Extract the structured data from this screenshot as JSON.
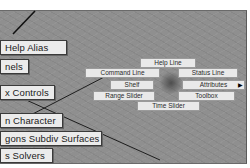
{
  "left_menus": [
    {
      "label": "Help   Alias"
    },
    {
      "label": "nels"
    },
    {
      "label": "x Controls"
    },
    {
      "label": "n   Character"
    },
    {
      "label": "gons   Subdiv Surfaces"
    },
    {
      "label": "s   Solvers"
    }
  ],
  "marking_menu": {
    "north": {
      "label": "Help Line"
    },
    "north_west": {
      "label": "Command Line"
    },
    "north_east": {
      "label": "Status Line"
    },
    "west": {
      "label": "Shelf"
    },
    "east": {
      "label": "Attributes",
      "submenu_arrow": "▶"
    },
    "south_west": {
      "label": "Range Slider"
    },
    "south_east": {
      "label": "Toolbox"
    },
    "south": {
      "label": "Time Slider"
    }
  },
  "colors": {
    "viewport_bg": "#8f8f8f",
    "button_bg": "#ebebeb",
    "marking_item_bg": "#e9e9e9",
    "line_color": "#111111"
  }
}
